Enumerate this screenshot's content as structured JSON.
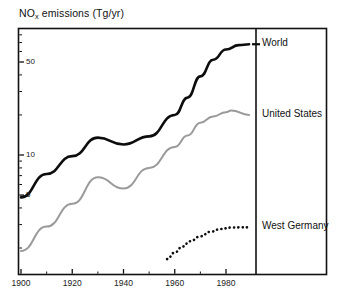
{
  "chart_data": {
    "type": "line",
    "title": "NOx emissions  (Tg/yr)",
    "title_main": "NO",
    "title_sub": "x",
    "title_rest": " emissions  (Tg/yr)",
    "xlabel": "",
    "ylabel": "NOx emissions (Tg/yr)",
    "yscale": "log",
    "xlim": [
      1900,
      1990
    ],
    "ylim": [
      1.6,
      110
    ],
    "grid": false,
    "legend_position": "right-panel",
    "ytick_labels": [
      "50",
      "10",
      "5"
    ],
    "ytick_values": [
      50,
      10,
      5
    ],
    "xtick_labels": [
      "1900",
      "1920",
      "1940",
      "1960",
      "1980"
    ],
    "xtick_values": [
      1900,
      1920,
      1940,
      1960,
      1980
    ],
    "series": [
      {
        "name": "World",
        "color": "#0d0d0d",
        "style": "solid",
        "x": [
          1900,
          1910,
          1920,
          1930,
          1940,
          1950,
          1960,
          1965,
          1970,
          1975,
          1980,
          1985,
          1989
        ],
        "values": [
          4.8,
          7.2,
          9.8,
          13.5,
          12.0,
          13.8,
          20.0,
          27.0,
          39.0,
          52.0,
          62.0,
          67.0,
          68.0
        ]
      },
      {
        "name": "United States",
        "color": "#9a9a9a",
        "style": "solid",
        "x": [
          1900,
          1910,
          1920,
          1930,
          1940,
          1950,
          1960,
          1965,
          1970,
          1975,
          1980,
          1982,
          1989
        ],
        "values": [
          1.9,
          2.9,
          4.3,
          6.8,
          5.6,
          8.0,
          11.5,
          14.0,
          17.5,
          19.5,
          21.0,
          21.6,
          20.0
        ]
      },
      {
        "name": "West Germany",
        "color": "#0d0d0d",
        "style": "dotted",
        "x": [
          1957,
          1960,
          1963,
          1966,
          1970,
          1974,
          1978,
          1982,
          1986,
          1989
        ],
        "values": [
          1.65,
          1.85,
          2.05,
          2.25,
          2.45,
          2.65,
          2.78,
          2.85,
          2.86,
          2.86
        ]
      }
    ],
    "legend_entries": [
      {
        "label": "World"
      },
      {
        "label": "United States"
      },
      {
        "label": "West Germany"
      }
    ]
  }
}
